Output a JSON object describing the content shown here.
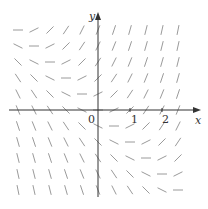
{
  "chart_data": {
    "type": "direction_field",
    "equation": "y' = x + y",
    "title": "",
    "xlabel": "x",
    "ylabel": "y",
    "x_ticks": [
      {
        "value": 0,
        "label": "0"
      },
      {
        "value": 1,
        "label": "1"
      },
      {
        "value": 2,
        "label": "2"
      }
    ],
    "grid_spacing": 0.5,
    "x_range": [
      -2.5,
      2.5
    ],
    "y_range": [
      -2.5,
      2.5
    ],
    "grid": false,
    "legend": null
  },
  "axes": {
    "x_label": "x",
    "y_label": "y",
    "origin_label": "0",
    "tick_1": "1",
    "tick_2": "2"
  },
  "style": {
    "axis_color": "#333333",
    "segment_color": "#9a9a9a"
  },
  "layout": {
    "origin_px": [
      98,
      110
    ],
    "unit_px": 32,
    "segment_length_px": 10
  }
}
